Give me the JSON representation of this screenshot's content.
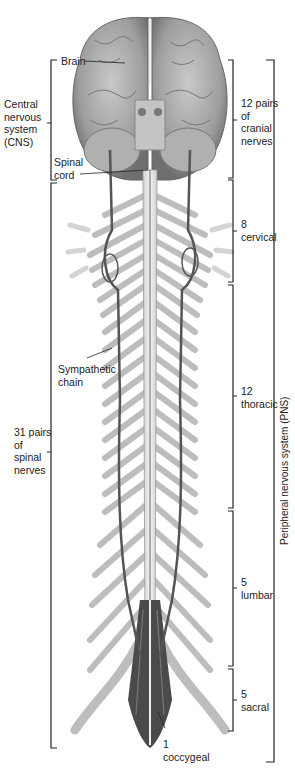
{
  "figure": {
    "colors": {
      "background": "#ffffff",
      "brain": "#a9a9a9",
      "brain_dark": "#6e6e6e",
      "spinal_nerves": "#bdbdbd",
      "sympathetic_chain": "#555555",
      "bracket": "#222222",
      "text": "#222222"
    }
  },
  "labels": {
    "brain": "Brain",
    "cns": [
      "Central",
      "nervous",
      "system",
      "(CNS)"
    ],
    "spinal_cord": [
      "Spinal",
      "cord"
    ],
    "sympathetic_chain": [
      "Sympathetic",
      "chain"
    ],
    "spinal_nerves": [
      "31 pairs",
      "of",
      "spinal",
      "nerves"
    ],
    "cranial_nerves": [
      "12 pairs",
      "of",
      "cranial",
      "nerves"
    ],
    "cervical": [
      "8",
      "cervical"
    ],
    "thoracic": [
      "12",
      "thoracic"
    ],
    "lumbar": [
      "5",
      "lumbar"
    ],
    "sacral": [
      "5",
      "sacral"
    ],
    "coccygeal": [
      "1",
      "coccygeal"
    ],
    "pns": "Peripheral nervous system (PNS)"
  },
  "brackets": {
    "left": [
      {
        "name": "cns",
        "top": 60,
        "bottom": 180
      },
      {
        "name": "spinal-nerves",
        "top": 183,
        "bottom": 748
      }
    ],
    "right_inner": [
      {
        "name": "cranial",
        "top": 60,
        "bottom": 178
      },
      {
        "name": "cervical",
        "top": 180,
        "bottom": 282
      },
      {
        "name": "thoracic",
        "top": 285,
        "bottom": 508
      },
      {
        "name": "lumbar",
        "top": 511,
        "bottom": 666
      },
      {
        "name": "sacral",
        "top": 669,
        "bottom": 731
      }
    ],
    "right_outer": {
      "name": "pns",
      "top": 60,
      "bottom": 762
    }
  }
}
